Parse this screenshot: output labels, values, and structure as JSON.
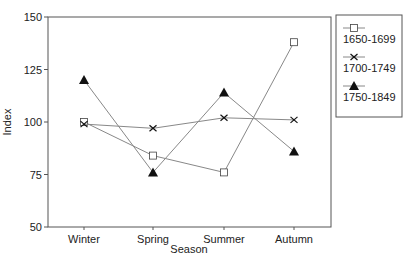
{
  "chart_data": {
    "type": "line",
    "title": "",
    "xlabel": "Season",
    "ylabel": "Index",
    "categories": [
      "Winter",
      "Spring",
      "Summer",
      "Autumn"
    ],
    "ylim": [
      50,
      150
    ],
    "yticks": [
      50,
      75,
      100,
      125,
      150
    ],
    "grid": false,
    "legend_position": "right",
    "series": [
      {
        "name": "1650-1699",
        "marker": "open-square",
        "values": [
          100,
          84,
          76,
          138
        ]
      },
      {
        "name": "1700-1749",
        "marker": "x-cross",
        "values": [
          99,
          97,
          102,
          101
        ]
      },
      {
        "name": "1750-1849",
        "marker": "filled-triangle",
        "values": [
          120,
          76,
          114,
          86
        ]
      }
    ]
  },
  "colors": {
    "line": "#888888",
    "axis": "#555555",
    "text": "#222222",
    "marker": "#111111"
  }
}
